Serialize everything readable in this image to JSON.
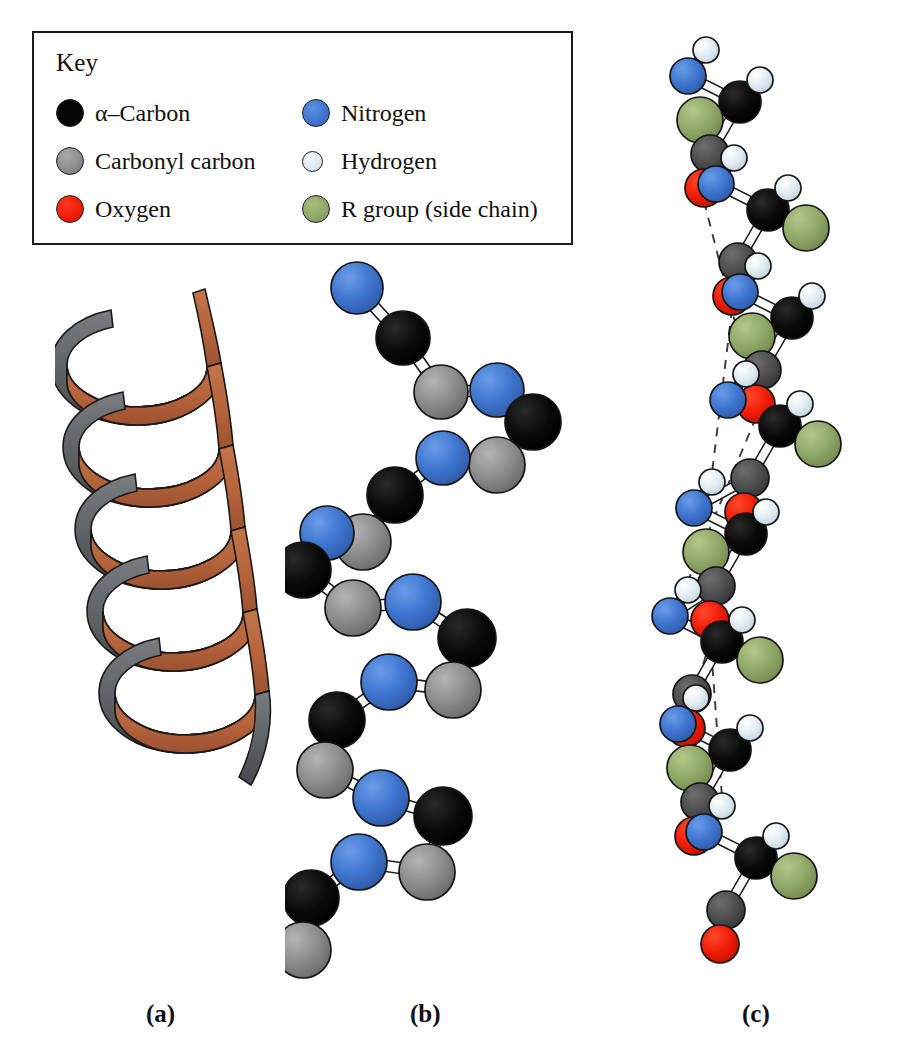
{
  "figure": {
    "panels": [
      {
        "id": "a",
        "label": "(a)",
        "caption": "Ribbon model of the alpha helix"
      },
      {
        "id": "b",
        "label": "(b)",
        "caption": "Ball-and-stick backbone trace"
      },
      {
        "id": "c",
        "label": "(c)",
        "caption": "Full atomic model with hydrogen bonds"
      }
    ]
  },
  "legend": {
    "title": "Key",
    "left_column": [
      {
        "label": "α–Carbon",
        "color": "#050505",
        "icon": "atom-sphere-icon",
        "size": "large"
      },
      {
        "label": "Carbonyl carbon",
        "color": "#8d8d8d",
        "icon": "atom-sphere-icon",
        "size": "large"
      },
      {
        "label": "Oxygen",
        "color": "#f21d06",
        "icon": "atom-sphere-icon",
        "size": "large"
      }
    ],
    "right_column": [
      {
        "label": "Nitrogen",
        "color": "#3f76cf",
        "icon": "atom-sphere-icon",
        "size": "large"
      },
      {
        "label": "Hydrogen",
        "color": "#dde8ef",
        "icon": "atom-sphere-icon",
        "size": "small"
      },
      {
        "label": "R group (side chain)",
        "color": "#90a968",
        "icon": "atom-sphere-icon",
        "size": "large"
      }
    ]
  },
  "colors": {
    "alpha_carbon": "#050505",
    "carbonyl_carbon": "#8d8d8d",
    "oxygen": "#f21d06",
    "nitrogen": "#3f76cf",
    "hydrogen": "#dde8ef",
    "r_group": "#90a968",
    "ribbon_front": "#b5633a",
    "ribbon_back": "#5e6164",
    "bond": "#ffffff",
    "outline": "#1a1a1a",
    "hbond": "#3a3a3a",
    "background": "#ffffff"
  },
  "panel_a": {
    "name": "ribbon-helix",
    "turns": 4,
    "ribbon_front_color": "#b5633a",
    "ribbon_back_color": "#5e6164"
  },
  "panel_b": {
    "name": "backbone-ball-and-stick",
    "atom_sequence": [
      "nitrogen",
      "alpha_carbon",
      "carbonyl_carbon",
      "nitrogen",
      "alpha_carbon",
      "carbonyl_carbon",
      "nitrogen",
      "alpha_carbon",
      "carbonyl_carbon",
      "nitrogen",
      "alpha_carbon",
      "carbonyl_carbon",
      "nitrogen",
      "alpha_carbon",
      "carbonyl_carbon",
      "nitrogen",
      "alpha_carbon",
      "carbonyl_carbon"
    ],
    "atoms": [
      {
        "t": "nitrogen",
        "x": 72,
        "y": 38,
        "r": 26
      },
      {
        "t": "alpha_carbon",
        "x": 118,
        "y": 88,
        "r": 27
      },
      {
        "t": "carbonyl_carbon",
        "x": 156,
        "y": 142,
        "r": 27
      },
      {
        "t": "nitrogen",
        "x": 212,
        "y": 140,
        "r": 27
      },
      {
        "t": "alpha_carbon",
        "x": 248,
        "y": 172,
        "r": 28
      },
      {
        "t": "carbonyl_carbon",
        "x": 212,
        "y": 215,
        "r": 28
      },
      {
        "t": "nitrogen",
        "x": 158,
        "y": 208,
        "r": 27
      },
      {
        "t": "alpha_carbon",
        "x": 110,
        "y": 245,
        "r": 28
      },
      {
        "t": "carbonyl_carbon",
        "x": 78,
        "y": 292,
        "r": 28
      },
      {
        "t": "nitrogen",
        "x": 42,
        "y": 283,
        "r": 27
      },
      {
        "t": "alpha_carbon",
        "x": 18,
        "y": 320,
        "r": 28
      },
      {
        "t": "carbonyl_carbon",
        "x": 68,
        "y": 358,
        "r": 28
      },
      {
        "t": "nitrogen",
        "x": 128,
        "y": 352,
        "r": 28
      },
      {
        "t": "alpha_carbon",
        "x": 182,
        "y": 388,
        "r": 29
      },
      {
        "t": "carbonyl_carbon",
        "x": 168,
        "y": 440,
        "r": 28
      },
      {
        "t": "nitrogen",
        "x": 104,
        "y": 432,
        "r": 28
      },
      {
        "t": "alpha_carbon",
        "x": 52,
        "y": 470,
        "r": 28
      },
      {
        "t": "carbonyl_carbon",
        "x": 40,
        "y": 520,
        "r": 28
      },
      {
        "t": "nitrogen",
        "x": 96,
        "y": 548,
        "r": 28
      },
      {
        "t": "alpha_carbon",
        "x": 158,
        "y": 566,
        "r": 29
      },
      {
        "t": "carbonyl_carbon",
        "x": 142,
        "y": 622,
        "r": 28
      },
      {
        "t": "nitrogen",
        "x": 74,
        "y": 612,
        "r": 28
      },
      {
        "t": "alpha_carbon",
        "x": 26,
        "y": 648,
        "r": 28
      },
      {
        "t": "carbonyl_carbon",
        "x": 18,
        "y": 700,
        "r": 28
      }
    ]
  },
  "panel_c": {
    "name": "atomic-model-with-hydrogen-bonds",
    "hydrogen_bond_count": 3,
    "hydrogen_bond_style": "dashed",
    "includes": [
      "alpha_carbon",
      "carbonyl_carbon",
      "oxygen",
      "nitrogen",
      "hydrogen",
      "r_group"
    ]
  }
}
